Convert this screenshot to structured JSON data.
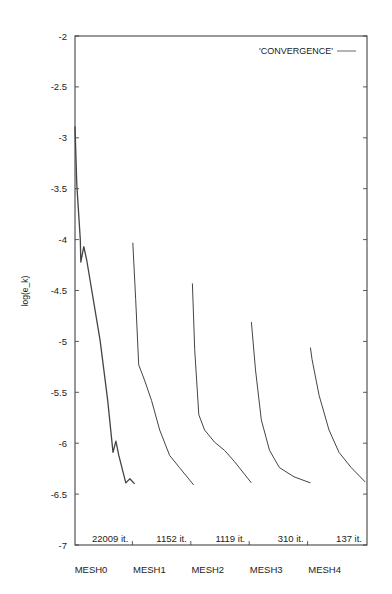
{
  "chart_data": {
    "type": "line",
    "title": "",
    "xlabel": "",
    "ylabel": "log(e_k)",
    "ylim": [
      -7,
      -2
    ],
    "xlim": [
      0,
      5
    ],
    "grid": false,
    "legend": {
      "position": "top-right",
      "entries": [
        "'CONVERGENCE'"
      ]
    },
    "y_ticks": [
      -2,
      -2.5,
      -3,
      -3.5,
      -4,
      -4.5,
      -5,
      -5.5,
      -6,
      -6.5,
      -7
    ],
    "y_tick_labels": [
      "-2",
      "-2.5",
      "-3",
      "-3.5",
      "-4",
      "-4.5",
      "-5",
      "-5.5",
      "-6",
      "-6.5",
      "-7"
    ],
    "x_categories": [
      "MESH0",
      "MESH1",
      "MESH2",
      "MESH3",
      "MESH4"
    ],
    "segment_annotations": [
      "22009 it.",
      "1152 it.",
      "1119 it.",
      "310 it.",
      "137 it."
    ],
    "x_note": "x is normalized segment position: each mesh occupies one unit width (0-1 MESH0, 1-2 MESH1, ...)",
    "series": [
      {
        "name": "MESH0",
        "legend": "'CONVERGENCE'",
        "iterations": 22009,
        "x": [
          0,
          0.03,
          0.09,
          0.1,
          0.15,
          0.2,
          0.43,
          0.56,
          0.65,
          0.7,
          0.75,
          0.87,
          0.94,
          1.02
        ],
        "values": [
          -2.89,
          -3.46,
          -4.0,
          -4.22,
          -4.07,
          -4.2,
          -4.99,
          -5.58,
          -6.09,
          -5.98,
          -6.12,
          -6.39,
          -6.35,
          -6.4
        ]
      },
      {
        "name": "MESH1",
        "legend": "'CONVERGENCE'",
        "iterations": 1152,
        "x": [
          0.99,
          1.04,
          1.09,
          1.19,
          1.31,
          1.45,
          1.62,
          1.79,
          2.03
        ],
        "values": [
          -4.03,
          -4.59,
          -5.23,
          -5.38,
          -5.58,
          -5.87,
          -6.12,
          -6.24,
          -6.41
        ]
      },
      {
        "name": "MESH2",
        "legend": "'CONVERGENCE'",
        "iterations": 1119,
        "x": [
          2.01,
          2.05,
          2.12,
          2.22,
          2.39,
          2.56,
          2.73,
          3.02
        ],
        "values": [
          -4.43,
          -5.08,
          -5.72,
          -5.87,
          -5.99,
          -6.07,
          -6.18,
          -6.39
        ]
      },
      {
        "name": "MESH3",
        "legend": "'CONVERGENCE'",
        "iterations": 310,
        "x": [
          3.02,
          3.09,
          3.19,
          3.33,
          3.5,
          3.75,
          4.03
        ],
        "values": [
          -4.81,
          -5.28,
          -5.77,
          -6.07,
          -6.24,
          -6.33,
          -6.39
        ]
      },
      {
        "name": "MESH4",
        "legend": "'CONVERGENCE'",
        "iterations": 137,
        "x": [
          4.03,
          4.06,
          4.18,
          4.35,
          4.52,
          4.73,
          4.97
        ],
        "values": [
          -5.06,
          -5.18,
          -5.53,
          -5.87,
          -6.09,
          -6.24,
          -6.38
        ]
      }
    ]
  },
  "colors": {
    "axis": "#333333",
    "line": "#444444",
    "background": "#ffffff"
  }
}
